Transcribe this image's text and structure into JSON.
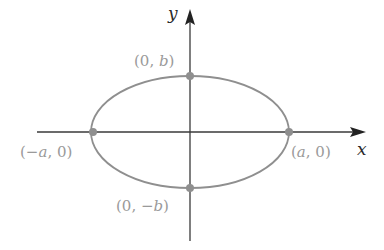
{
  "diagram": {
    "type": "ellipse",
    "colors": {
      "axis": "#3a3a3a",
      "curve": "#8f8f8f",
      "point": "#8f8f8f",
      "label": "#9a9a9a"
    },
    "axes": {
      "x_label": "x",
      "y_label": "y"
    },
    "points": [
      {
        "id": "top",
        "prefix": "(0, ",
        "var": "b",
        "suffix": ")"
      },
      {
        "id": "left",
        "prefix": "(−",
        "var": "a",
        "suffix": ", 0)"
      },
      {
        "id": "right",
        "prefix": "(",
        "var": "a",
        "suffix": ", 0)"
      },
      {
        "id": "bottom",
        "prefix": "(0, −",
        "var": "b",
        "suffix": ")"
      }
    ]
  }
}
